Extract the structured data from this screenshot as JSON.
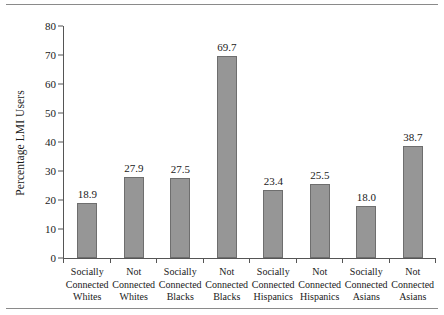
{
  "chart_data": {
    "type": "bar",
    "title": "",
    "xlabel": "",
    "ylabel": "Percentage LMI Users",
    "ylim": [
      0,
      80
    ],
    "ytick_values": [
      80,
      70,
      60,
      50,
      40,
      30,
      20,
      10,
      0
    ],
    "ytick_labels": [
      "80",
      "70",
      "60",
      "50",
      "40",
      "30",
      "20",
      "10",
      "0"
    ],
    "grid": false,
    "legend": "none",
    "bar_color": "#969696",
    "bar_edge_color": "#6e6e6e",
    "axis_color": "#555555",
    "categories": [
      "Socially Connected Whites",
      "Not Connected Whites",
      "Socially Connected Blacks",
      "Not Connected Blacks",
      "Socially Connected Hispanics",
      "Not Connected Hispanics",
      "Socially Connected Asians",
      "Not Connected Asians"
    ],
    "category_lines": [
      [
        "Socially",
        "Connected",
        "Whites"
      ],
      [
        "Not",
        "Connected",
        "Whites"
      ],
      [
        "Socially",
        "Connected",
        "Blacks"
      ],
      [
        "Not",
        "Connected",
        "Blacks"
      ],
      [
        "Socially",
        "Connected",
        "Hispanics"
      ],
      [
        "Not",
        "Connected",
        "Hispanics"
      ],
      [
        "Socially",
        "Connected",
        "Asians"
      ],
      [
        "Not",
        "Connected",
        "Asians"
      ]
    ],
    "values": [
      18.9,
      27.9,
      27.5,
      69.7,
      23.4,
      25.5,
      18.0,
      38.7
    ],
    "value_labels": [
      "18.9",
      "27.9",
      "27.5",
      "69.7",
      "23.4",
      "25.5",
      "18.0",
      "38.7"
    ]
  }
}
